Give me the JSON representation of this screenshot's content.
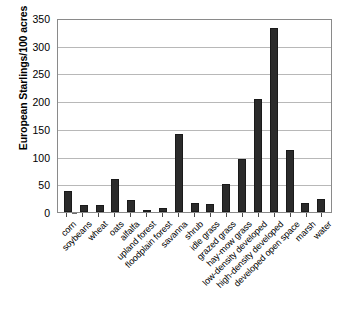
{
  "chart_data": {
    "type": "bar",
    "title": "",
    "subtitle": "",
    "xlabel": "",
    "ylabel": "European Starlings/100 acres",
    "ylim": [
      0,
      350
    ],
    "ytick_labels": [
      "350",
      "300",
      "250",
      "200",
      "150",
      "100",
      "50",
      "0"
    ],
    "ytick_values": [
      350,
      300,
      250,
      200,
      150,
      100,
      50,
      0
    ],
    "grid": true,
    "legend": null,
    "legend_position": "none",
    "bar_color": "#2b2b2b",
    "categories": [
      "corn",
      "soybeans",
      "wheat",
      "oats",
      "alfalfa",
      "upland forest",
      "floodplain forest",
      "savanna",
      "shrub",
      "idle grass",
      "grazed grass",
      "hay-mow grass",
      "low-density developed",
      "high-density developed",
      "developed open space",
      "marsh",
      "water"
    ],
    "values": [
      38,
      13,
      12,
      60,
      21,
      4,
      8,
      141,
      17,
      14,
      51,
      95,
      203,
      332,
      112,
      17,
      23
    ]
  }
}
